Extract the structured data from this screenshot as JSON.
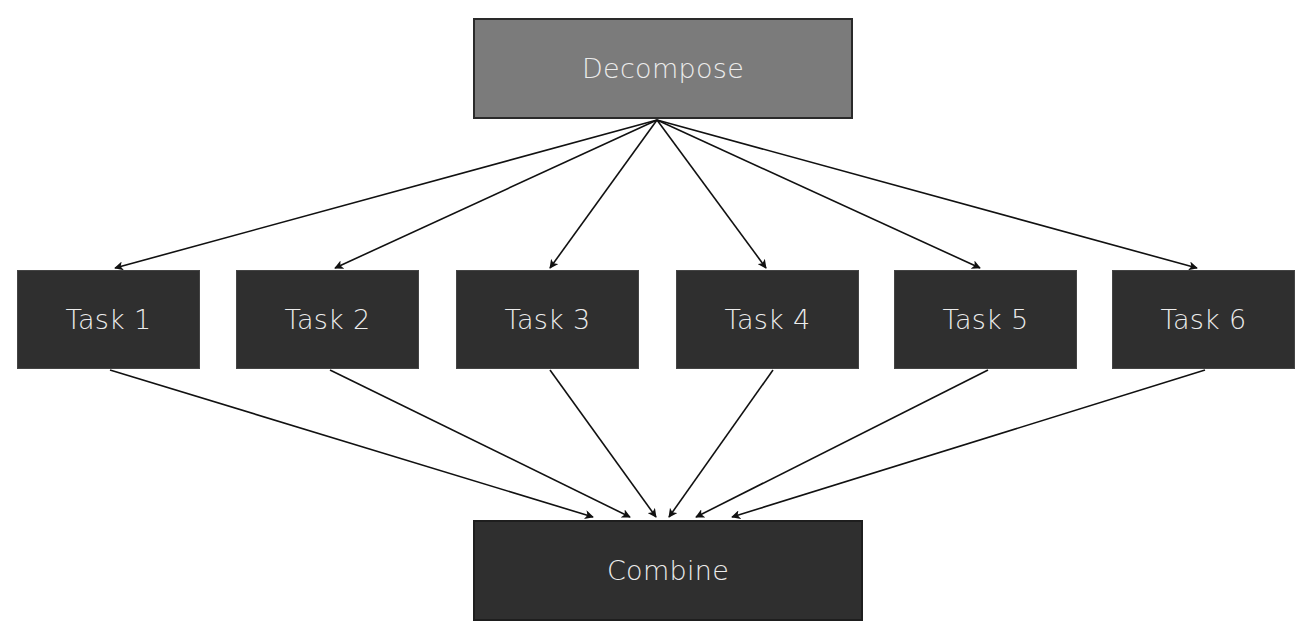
{
  "diagram": {
    "type": "fork-join flow",
    "colors": {
      "decompose_fill": "#7b7b7b",
      "task_fill": "#2f2f2f",
      "combine_fill": "#2f2f2f",
      "text": "#ececec",
      "arrow": "#111111"
    },
    "nodes": {
      "decompose": {
        "label": "Decompose",
        "x": 473,
        "y": 18,
        "w": 380,
        "h": 101
      },
      "tasks": [
        {
          "label": "Task 1",
          "x": 17,
          "y": 270,
          "w": 183,
          "h": 99
        },
        {
          "label": "Task 2",
          "x": 236,
          "y": 270,
          "w": 183,
          "h": 99
        },
        {
          "label": "Task 3",
          "x": 456,
          "y": 270,
          "w": 183,
          "h": 99
        },
        {
          "label": "Task 4",
          "x": 676,
          "y": 270,
          "w": 183,
          "h": 99
        },
        {
          "label": "Task 5",
          "x": 894,
          "y": 270,
          "w": 183,
          "h": 99
        },
        {
          "label": "Task 6",
          "x": 1112,
          "y": 270,
          "w": 183,
          "h": 99
        }
      ],
      "combine": {
        "label": "Combine",
        "x": 473,
        "y": 520,
        "w": 390,
        "h": 101
      }
    },
    "edges": [
      {
        "from": "Decompose",
        "to": "Task 1",
        "x1": 657,
        "y1": 120,
        "x2": 115,
        "y2": 268
      },
      {
        "from": "Decompose",
        "to": "Task 2",
        "x1": 657,
        "y1": 120,
        "x2": 335,
        "y2": 268
      },
      {
        "from": "Decompose",
        "to": "Task 3",
        "x1": 657,
        "y1": 120,
        "x2": 550,
        "y2": 268
      },
      {
        "from": "Decompose",
        "to": "Task 4",
        "x1": 657,
        "y1": 120,
        "x2": 766,
        "y2": 268
      },
      {
        "from": "Decompose",
        "to": "Task 5",
        "x1": 657,
        "y1": 120,
        "x2": 980,
        "y2": 268
      },
      {
        "from": "Decompose",
        "to": "Task 6",
        "x1": 657,
        "y1": 120,
        "x2": 1197,
        "y2": 268
      },
      {
        "from": "Task 1",
        "to": "Combine",
        "x1": 110,
        "y1": 370,
        "x2": 593,
        "y2": 517
      },
      {
        "from": "Task 2",
        "to": "Combine",
        "x1": 330,
        "y1": 370,
        "x2": 630,
        "y2": 517
      },
      {
        "from": "Task 3",
        "to": "Combine",
        "x1": 550,
        "y1": 370,
        "x2": 656,
        "y2": 517
      },
      {
        "from": "Task 4",
        "to": "Combine",
        "x1": 773,
        "y1": 370,
        "x2": 669,
        "y2": 517
      },
      {
        "from": "Task 5",
        "to": "Combine",
        "x1": 988,
        "y1": 370,
        "x2": 696,
        "y2": 517
      },
      {
        "from": "Task 6",
        "to": "Combine",
        "x1": 1205,
        "y1": 370,
        "x2": 732,
        "y2": 517
      }
    ]
  }
}
